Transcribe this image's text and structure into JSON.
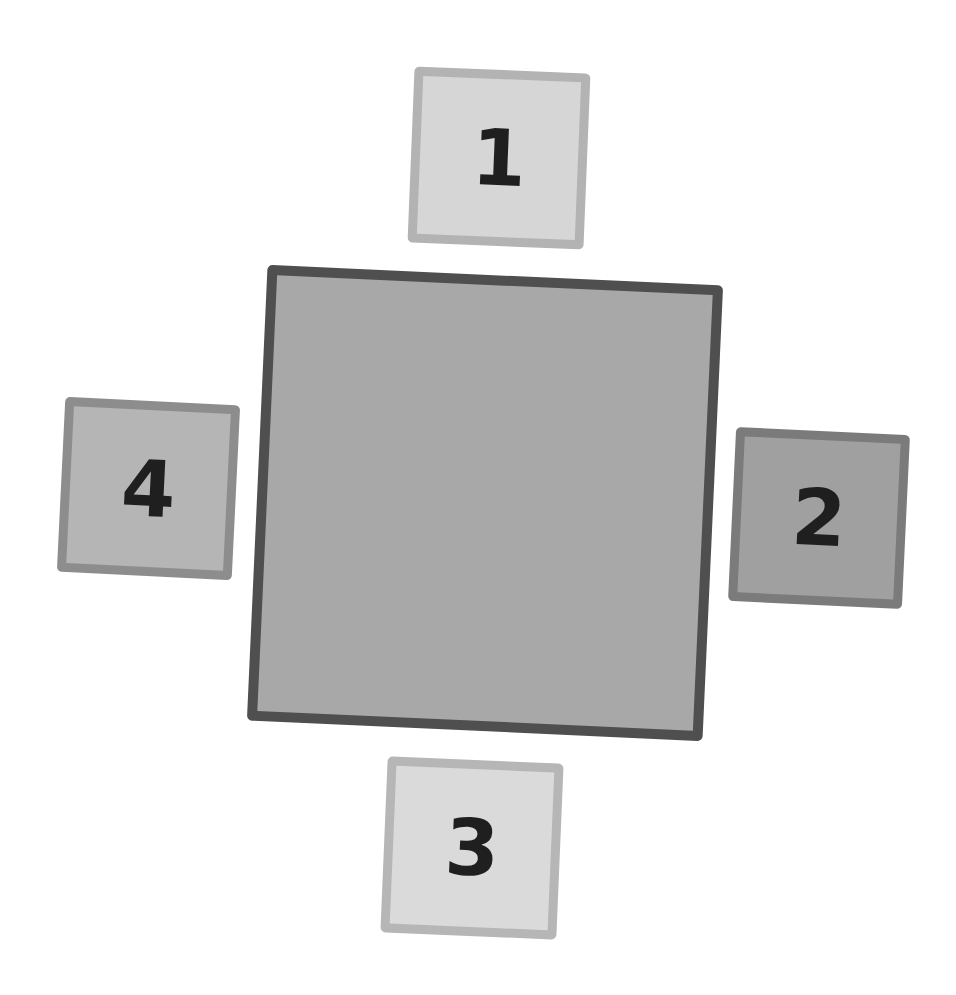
{
  "diagram": {
    "center": {
      "label": "",
      "fill": "#a8a8a8",
      "border": "#4f4f4f"
    },
    "tiles": [
      {
        "label": "1",
        "position": "top",
        "fill": "#d6d6d6",
        "border": "#b3b3b3"
      },
      {
        "label": "2",
        "position": "right",
        "fill": "#a0a0a0",
        "border": "#7b7b7b"
      },
      {
        "label": "3",
        "position": "bottom",
        "fill": "#dadada",
        "border": "#b6b6b6"
      },
      {
        "label": "4",
        "position": "left",
        "fill": "#b5b5b5",
        "border": "#8d8d8d"
      }
    ]
  }
}
